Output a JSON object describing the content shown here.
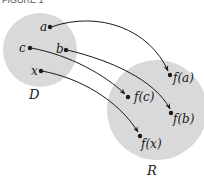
{
  "figure": {
    "caption_partial": "FIGURE 1",
    "background": "#ffffff",
    "set_fill": "#d9d9d9",
    "ink": "#1a1a1a"
  },
  "domain_set": {
    "label": "D",
    "elements": [
      {
        "name": "a",
        "label": "a"
      },
      {
        "name": "b",
        "label": "b"
      },
      {
        "name": "c",
        "label": "c"
      },
      {
        "name": "x",
        "label": "x"
      }
    ]
  },
  "range_set": {
    "label": "R",
    "elements": [
      {
        "name": "fa",
        "label": "f(a)"
      },
      {
        "name": "fb",
        "label": "f(b)"
      },
      {
        "name": "fc",
        "label": "f(c)"
      },
      {
        "name": "fx",
        "label": "f(x)"
      }
    ]
  },
  "mappings": [
    {
      "from": "a",
      "to": "f(a)"
    },
    {
      "from": "b",
      "to": "f(b)"
    },
    {
      "from": "c",
      "to": "f(c)"
    },
    {
      "from": "x",
      "to": "f(x)"
    }
  ]
}
